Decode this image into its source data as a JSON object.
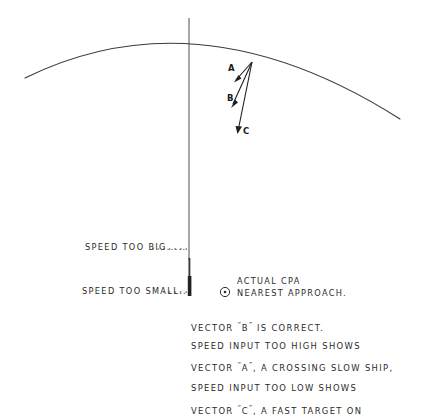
{
  "figure": {
    "title_hidden": "",
    "type": "hand-drawn radar plotting diagram",
    "ink_color": "#2b2b2b",
    "background_color": "#ffffff"
  },
  "vectors": [
    {
      "id": "vector-a",
      "label": "A",
      "label_x": 230,
      "label_y": 68,
      "x1": 252,
      "y1": 62,
      "x2": 234,
      "y2": 82,
      "meaning": "speed input too high, a crossing slow ship"
    },
    {
      "id": "vector-b",
      "label": "B",
      "label_x": 230,
      "label_y": 98,
      "x1": 252,
      "y1": 62,
      "x2": 231,
      "y2": 107,
      "meaning": "correct vector"
    },
    {
      "id": "vector-c",
      "label": "C",
      "label_x": 243,
      "label_y": 130,
      "x1": 252,
      "y1": 62,
      "x2": 238,
      "y2": 133,
      "meaning": "speed input too low, a fast target on"
    }
  ],
  "annotations": {
    "speed_too_big": "SPEED TOO BIG",
    "speed_too_big_dots": ".....",
    "speed_too_small": "SPEED TOO SMALL",
    "speed_too_small_dots": "...",
    "cpa_line_1": "ACTUAL CPA",
    "cpa_line_2": "NEAREST APPROACH.",
    "cpa_symbol": "circled-dot-icon"
  },
  "caption": {
    "lines": [
      {
        "before": "VECTOR ",
        "quoted": "B",
        "after": " IS CORRECT."
      },
      {
        "before": "SPEED INPUT TOO HIGH SHOWS",
        "quoted": "",
        "after": ""
      },
      {
        "before": "VECTOR ",
        "quoted": "A",
        "after": ", A CROSSING SLOW SHIP,"
      },
      {
        "before": "SPEED INPUT TOO LOW SHOWS",
        "quoted": "",
        "after": ""
      },
      {
        "before": "VECTOR ",
        "quoted": "C",
        "after": ", A FAST TARGET ON"
      }
    ]
  }
}
